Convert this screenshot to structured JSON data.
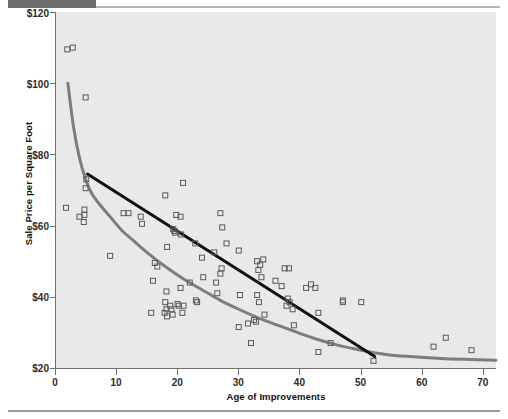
{
  "figure": {
    "top_bar_color": "#6d6d6d",
    "plot_background": "#e9e9e9",
    "axis_color": "#6f6f6f"
  },
  "axes": {
    "y_title": "Sale Price per Square Foot",
    "x_title": "Age of Improvements",
    "y_ticks": [
      "$120",
      "$100",
      "$80",
      "$60",
      "$40",
      "$20"
    ],
    "x_ticks": [
      "0",
      "10",
      "20",
      "30",
      "40",
      "50",
      "60",
      "70"
    ]
  },
  "chart_data": {
    "type": "scatter",
    "title": "",
    "xlabel": "Age of Improvements",
    "ylabel": "Sale Price per Square Foot",
    "xlim": [
      0,
      72
    ],
    "ylim": [
      20,
      120
    ],
    "xticks": [
      0,
      10,
      20,
      30,
      40,
      50,
      60,
      70
    ],
    "yticks": [
      20,
      40,
      60,
      80,
      100,
      120
    ],
    "ytick_labels": [
      "$20",
      "$40",
      "$60",
      "$80",
      "$100",
      "$120"
    ],
    "grid": false,
    "legend": "none",
    "marker": {
      "shape": "open-square",
      "size": 5,
      "edge_color": "#5a5a5a",
      "fill": "none"
    },
    "points": [
      [
        2.0,
        109.5
      ],
      [
        2.9,
        110.0
      ],
      [
        5.0,
        96.0
      ],
      [
        5.1,
        73.0
      ],
      [
        5.0,
        70.5
      ],
      [
        1.8,
        65.0
      ],
      [
        4.0,
        62.5
      ],
      [
        4.8,
        64.5
      ],
      [
        4.8,
        63.0
      ],
      [
        4.7,
        61.0
      ],
      [
        9.0,
        51.5
      ],
      [
        11.2,
        63.5
      ],
      [
        12.0,
        63.5
      ],
      [
        14.0,
        62.5
      ],
      [
        14.2,
        60.5
      ],
      [
        16.3,
        49.5
      ],
      [
        16.7,
        48.5
      ],
      [
        16.0,
        44.5
      ],
      [
        15.7,
        35.5
      ],
      [
        18.0,
        68.5
      ],
      [
        18.3,
        54.0
      ],
      [
        18.2,
        41.5
      ],
      [
        18.0,
        38.5
      ],
      [
        18.2,
        36.5
      ],
      [
        17.9,
        35.5
      ],
      [
        18.3,
        34.5
      ],
      [
        18.8,
        37.5
      ],
      [
        19.0,
        36.5
      ],
      [
        19.2,
        35.0
      ],
      [
        19.3,
        59.0
      ],
      [
        19.5,
        58.5
      ],
      [
        19.6,
        58.0
      ],
      [
        19.8,
        63.0
      ],
      [
        20.5,
        62.5
      ],
      [
        20.6,
        57.5
      ],
      [
        20.5,
        42.5
      ],
      [
        20.0,
        38.0
      ],
      [
        20.2,
        37.5
      ],
      [
        20.9,
        72.0
      ],
      [
        21.0,
        37.5
      ],
      [
        20.8,
        35.5
      ],
      [
        22.0,
        44.0
      ],
      [
        23.0,
        39.0
      ],
      [
        23.2,
        38.5
      ],
      [
        22.9,
        55.0
      ],
      [
        24.0,
        51.0
      ],
      [
        24.2,
        45.5
      ],
      [
        26.0,
        52.5
      ],
      [
        26.3,
        44.0
      ],
      [
        26.5,
        41.0
      ],
      [
        27.0,
        63.5
      ],
      [
        27.3,
        59.5
      ],
      [
        27.2,
        48.0
      ],
      [
        27.0,
        46.5
      ],
      [
        28.0,
        55.0
      ],
      [
        30.0,
        53.0
      ],
      [
        30.2,
        40.5
      ],
      [
        30.0,
        31.5
      ],
      [
        31.5,
        32.5
      ],
      [
        32.0,
        27.0
      ],
      [
        32.5,
        33.5
      ],
      [
        32.8,
        33.0
      ],
      [
        33.0,
        50.0
      ],
      [
        33.5,
        49.0
      ],
      [
        34.0,
        50.5
      ],
      [
        33.2,
        47.5
      ],
      [
        33.7,
        45.5
      ],
      [
        33.0,
        40.5
      ],
      [
        33.3,
        38.5
      ],
      [
        34.2,
        35.0
      ],
      [
        36.0,
        44.5
      ],
      [
        37.0,
        43.0
      ],
      [
        37.5,
        48.0
      ],
      [
        38.2,
        48.0
      ],
      [
        38.0,
        39.5
      ],
      [
        38.3,
        38.5
      ],
      [
        37.8,
        37.5
      ],
      [
        38.8,
        36.5
      ],
      [
        39.0,
        32.0
      ],
      [
        41.0,
        42.5
      ],
      [
        41.8,
        43.5
      ],
      [
        42.5,
        42.5
      ],
      [
        43.0,
        35.5
      ],
      [
        43.0,
        24.5
      ],
      [
        45.0,
        27.0
      ],
      [
        47.0,
        39.0
      ],
      [
        47.0,
        38.5
      ],
      [
        50.0,
        38.5
      ],
      [
        52.0,
        22.0
      ],
      [
        61.8,
        26.0
      ],
      [
        63.8,
        28.5
      ],
      [
        68.0,
        25.0
      ]
    ],
    "curves": [
      {
        "name": "power-curve",
        "style": "solid",
        "color": "#7d7d7d",
        "width": 3,
        "points": [
          [
            2.1,
            100.0
          ],
          [
            3.0,
            88.0
          ],
          [
            4.0,
            79.0
          ],
          [
            5.0,
            73.0
          ],
          [
            6.0,
            69.0
          ],
          [
            7.5,
            65.5
          ],
          [
            9.0,
            62.5
          ],
          [
            11.0,
            58.5
          ],
          [
            13.0,
            55.5
          ],
          [
            15.0,
            52.5
          ],
          [
            18.0,
            48.5
          ],
          [
            21.0,
            45.0
          ],
          [
            24.0,
            42.0
          ],
          [
            27.0,
            39.0
          ],
          [
            30.0,
            36.5
          ],
          [
            34.0,
            33.5
          ],
          [
            38.0,
            31.0
          ],
          [
            42.0,
            28.5
          ],
          [
            46.0,
            26.5
          ],
          [
            50.0,
            25.0
          ],
          [
            54.0,
            23.8
          ],
          [
            58.0,
            23.2
          ],
          [
            63.0,
            22.7
          ],
          [
            68.0,
            22.4
          ],
          [
            72.0,
            22.2
          ]
        ]
      },
      {
        "name": "linear-trend",
        "style": "solid",
        "color": "#111111",
        "width": 3,
        "points": [
          [
            5.3,
            74.5
          ],
          [
            52.2,
            23.2
          ]
        ]
      }
    ]
  }
}
